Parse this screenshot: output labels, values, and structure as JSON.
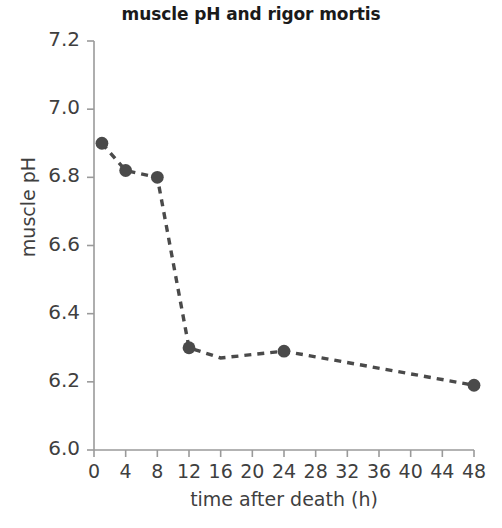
{
  "chart_data": {
    "type": "line",
    "title": "muscle pH and rigor mortis",
    "xlabel": "time after death (h)",
    "ylabel": "muscle pH",
    "xlim": [
      0,
      48
    ],
    "ylim": [
      6.0,
      7.2
    ],
    "xticks": [
      0,
      4,
      8,
      12,
      16,
      20,
      24,
      28,
      32,
      36,
      40,
      44,
      48
    ],
    "xtick_labels": [
      "0",
      "4",
      "8",
      "12",
      "16",
      "20",
      "24",
      "28",
      "32",
      "36",
      "40",
      "44",
      "48"
    ],
    "yticks": [
      6.0,
      6.2,
      6.4,
      6.6,
      6.8,
      7.0,
      7.2
    ],
    "ytick_labels": [
      "6.0",
      "6.2",
      "6.4",
      "6.6",
      "6.8",
      "7.0",
      "7.2"
    ],
    "grid": false,
    "legend": "none",
    "linestyle": "dashed",
    "marker": "circle",
    "color": "#4a4a4a",
    "axis_color": "#9a9a9a",
    "series": [
      {
        "name": "muscle pH",
        "x": [
          1,
          4,
          8,
          12,
          16,
          24,
          48
        ],
        "y": [
          6.9,
          6.82,
          6.8,
          6.3,
          6.27,
          6.29,
          6.19
        ],
        "marker_at": [
          1,
          4,
          8,
          12,
          24,
          48
        ]
      }
    ]
  }
}
